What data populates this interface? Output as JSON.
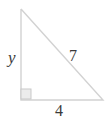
{
  "figure": {
    "kind": "right-triangle-diagram",
    "background_color": "#ffffff",
    "stroke_color": "#d2d2d2",
    "stroke_width": 1.4,
    "label_color": "#3a3a3a",
    "right_angle_marker": {
      "name": "right-angle-marker",
      "x": 21,
      "y": 89,
      "size": 10,
      "fill_color": "#ececec",
      "stroke_color": "#c9c9c9"
    },
    "vertices": {
      "apex": {
        "x": 21,
        "y": 9
      },
      "right_angle": {
        "x": 21,
        "y": 100
      },
      "base_right": {
        "x": 103,
        "y": 100
      }
    },
    "edges": [
      {
        "name": "vertical-leg",
        "from": "apex",
        "to": "right_angle",
        "label": "y"
      },
      {
        "name": "hypotenuse",
        "from": "apex",
        "to": "base_right",
        "label": "7"
      },
      {
        "name": "base-leg",
        "from": "right_angle",
        "to": "base_right",
        "label": "4"
      }
    ],
    "labels": {
      "vertical_leg": "y",
      "hypotenuse": "7",
      "base": "4"
    }
  }
}
